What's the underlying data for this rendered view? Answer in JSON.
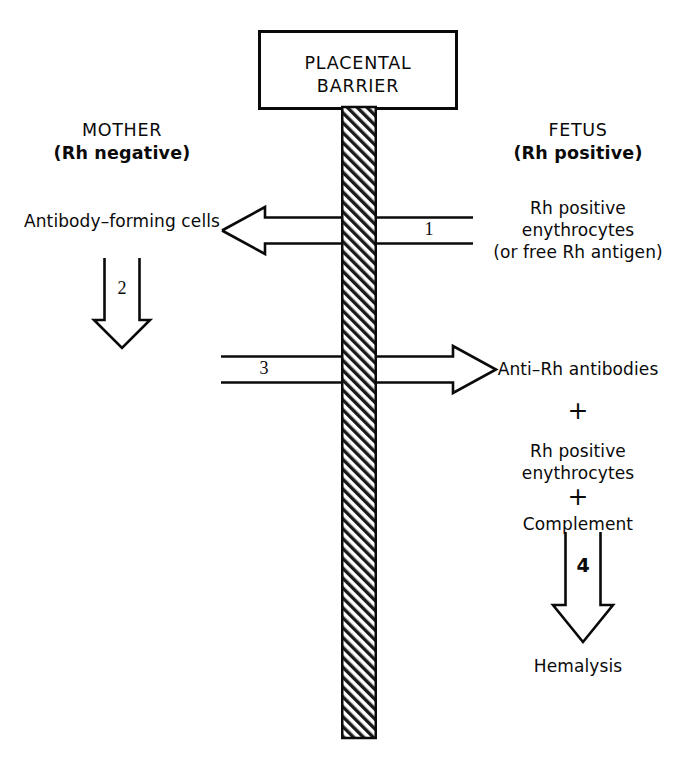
{
  "diagram": {
    "barrier_box": {
      "label_line1": "PLACENTAL",
      "label_line2": "BARRIER"
    },
    "columns": {
      "left": {
        "heading": "MOTHER",
        "subheading": "(Rh negative)",
        "nodes": [
          {
            "name": "antibody-forming-cells",
            "text": "Antibody–forming cells"
          }
        ]
      },
      "right": {
        "heading": "FETUS",
        "subheading": "(Rh positive)",
        "nodes": [
          {
            "name": "rh-positive-erythrocytes-top",
            "lines": [
              "Rh positive",
              "enythrocytes",
              "(or free Rh antigen)"
            ]
          },
          {
            "name": "anti-rh-antibodies",
            "lines": [
              "Anti–Rh antibodies"
            ]
          },
          {
            "name": "plus-1",
            "lines": [
              "+"
            ]
          },
          {
            "name": "rh-positive-erythrocytes-bottom",
            "lines": [
              "Rh positive",
              "enythrocytes"
            ]
          },
          {
            "name": "plus-2",
            "lines": [
              "+"
            ]
          },
          {
            "name": "complement",
            "lines": [
              "Complement"
            ]
          },
          {
            "name": "hemalysis",
            "lines": [
              "Hemalysis"
            ]
          }
        ]
      }
    },
    "arrows": [
      {
        "id": 1,
        "label": "1",
        "direction": "left",
        "from": "fetus",
        "to": "mother",
        "crosses_barrier": true
      },
      {
        "id": 2,
        "label": "2",
        "direction": "down",
        "from": "antibody-forming-cells",
        "to": "anti-rh-antibodies",
        "crosses_barrier": false
      },
      {
        "id": 3,
        "label": "3",
        "direction": "right",
        "from": "mother",
        "to": "fetus",
        "crosses_barrier": true
      },
      {
        "id": 4,
        "label": "4",
        "direction": "down",
        "from": "complement",
        "to": "hemalysis",
        "crosses_barrier": false
      }
    ],
    "colors": {
      "ink": "#0a0a0a",
      "background": "#ffffff",
      "hatch": "#1a1a1a"
    }
  }
}
